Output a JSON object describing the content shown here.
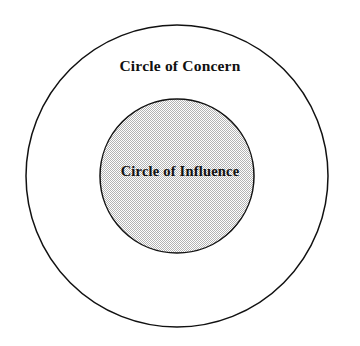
{
  "diagram": {
    "type": "concentric-circles",
    "canvas": {
      "width": 360,
      "height": 346,
      "background": "#ffffff"
    },
    "outer_circle": {
      "label": "Circle of Concern",
      "center_x": 177,
      "center_y": 176,
      "radius": 151,
      "fill": "#ffffff",
      "stroke": "#111111",
      "stroke_width": 1.5
    },
    "inner_circle": {
      "label": "Circle of Influence",
      "center_x": 177,
      "center_y": 176,
      "radius": 77,
      "fill": "#d8d8d8",
      "fill_pattern": "halftone-dither-checkerboard",
      "stroke": "#111111",
      "stroke_width": 1.5
    }
  }
}
